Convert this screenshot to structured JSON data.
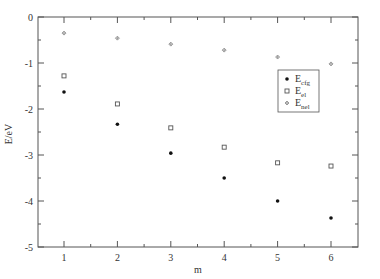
{
  "chart_data": {
    "type": "scatter",
    "title": "",
    "xlabel": "m",
    "ylabel": "E/eV",
    "xlim": [
      0.5,
      6.5
    ],
    "ylim": [
      -5,
      0
    ],
    "x": [
      1,
      2,
      3,
      4,
      5,
      6
    ],
    "xticks": [
      "1",
      "2",
      "3",
      "4",
      "5",
      "6"
    ],
    "yticks": [
      "0",
      "-1",
      "-2",
      "-3",
      "-4",
      "-5"
    ],
    "grid": false,
    "legend_position": "upper right (inside)",
    "series": [
      {
        "name": "E_cfg",
        "label_main": "E",
        "label_sub": "cfg",
        "marker": "filled-circle",
        "color": "#111111",
        "values": [
          -1.63,
          -2.33,
          -2.96,
          -3.5,
          -4.0,
          -4.37
        ]
      },
      {
        "name": "E_el",
        "label_main": "E",
        "label_sub": "el",
        "marker": "open-square",
        "color": "#555555",
        "values": [
          -1.28,
          -1.89,
          -2.41,
          -2.83,
          -3.17,
          -3.24
        ]
      },
      {
        "name": "E_nel",
        "label_main": "E",
        "label_sub": "nel",
        "marker": "plus-diamond",
        "color": "#777777",
        "values": [
          -0.35,
          -0.46,
          -0.59,
          -0.72,
          -0.87,
          -1.02
        ]
      }
    ]
  }
}
